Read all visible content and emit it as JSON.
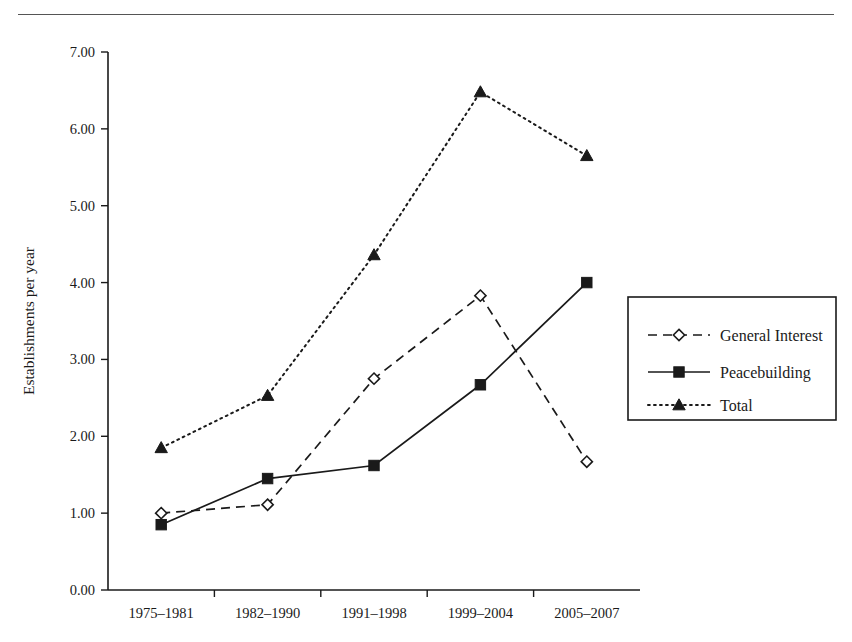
{
  "figure": {
    "has_top_rule": true,
    "background_color": "#ffffff",
    "ink_color": "#1a1a1a"
  },
  "chart_data": {
    "type": "line",
    "title": "",
    "xlabel": "",
    "ylabel": "Establishments per year",
    "categories": [
      "1975–1981",
      "1982–1990",
      "1991–1998",
      "1999–2004",
      "2005–2007"
    ],
    "ylim": [
      0,
      7
    ],
    "ytick_values": [
      0,
      1,
      2,
      3,
      4,
      5,
      6,
      7
    ],
    "ytick_labels": [
      "0.00",
      "1.00",
      "2.00",
      "3.00",
      "4.00",
      "5.00",
      "6.00",
      "7.00"
    ],
    "grid": false,
    "legend_position": "right",
    "series": [
      {
        "name": "General Interest",
        "values": [
          1.0,
          1.11,
          2.75,
          3.83,
          1.67
        ],
        "line_style": "dashed",
        "marker": "open-diamond",
        "color": "#1a1a1a"
      },
      {
        "name": "Peacebuilding",
        "values": [
          0.85,
          1.45,
          1.62,
          2.67,
          4.0
        ],
        "line_style": "solid",
        "marker": "filled-square",
        "color": "#1a1a1a"
      },
      {
        "name": "Total",
        "values": [
          1.85,
          2.53,
          4.36,
          6.48,
          5.65
        ],
        "line_style": "dotted",
        "marker": "filled-triangle",
        "color": "#1a1a1a"
      }
    ]
  },
  "legend": {
    "entries": [
      {
        "label": "General Interest",
        "marker": "open-diamond",
        "line_style": "dashed"
      },
      {
        "label": "Peacebuilding",
        "marker": "filled-square",
        "line_style": "solid"
      },
      {
        "label": "Total",
        "marker": "filled-triangle",
        "line_style": "dotted"
      }
    ]
  }
}
